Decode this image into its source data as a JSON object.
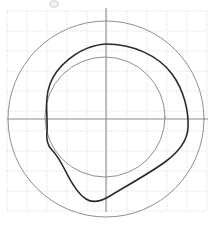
{
  "figure": {
    "width": 218,
    "height": 226,
    "background_color": "#ffffff",
    "title": "",
    "smudge_artifact_label": "scan-smudge"
  },
  "colors": {
    "grid": "#d8d8d8",
    "axis": "#8c8c8c",
    "light_curve": "#8f8f8f",
    "dark_curve": "#2b2b2b"
  },
  "grid": {
    "visible": true,
    "spacing_px": 20,
    "x_start": 7,
    "x_end": 207,
    "y_start": 11,
    "y_end": 211,
    "style": "dotted"
  },
  "axes": {
    "origin_x": 106,
    "origin_y": 119,
    "x_axis_start": 7,
    "x_axis_end": 208,
    "y_axis_start": 8,
    "y_axis_end": 212,
    "xlabel": "",
    "ylabel": "",
    "xticklabels": [],
    "yticklabels": []
  },
  "chart_data": {
    "type": "line",
    "title": "",
    "subtitle": "",
    "xlabel": "",
    "ylabel": "",
    "xlim": [
      -5,
      5
    ],
    "ylim": [
      -5,
      5
    ],
    "grid": true,
    "legend": "none",
    "coordinate_system": "polar-overlay-on-cartesian-grid",
    "annotations": [],
    "series": [
      {
        "name": "outer circle",
        "kind": "circle",
        "color": "#8f8f8f",
        "linewidth": 1,
        "center": [
          106,
          119
        ],
        "radius": 98,
        "values": []
      },
      {
        "name": "inner circle",
        "kind": "circle",
        "color": "#8f8f8f",
        "linewidth": 1,
        "center": [
          105,
          117
        ],
        "radius": 60,
        "values": []
      },
      {
        "name": "irregular closed curve",
        "kind": "closed-path",
        "color": "#2b2b2b",
        "linewidth": 1.6,
        "path": "M 106 44 C 132 44 158 55 172 74 C 184 90 189 112 188 128 C 187 143 176 154 165 162 C 150 173 128 185 110 196 C 100 202 92 203 86 199 C 78 194 72 184 66 172 C 60 160 56 154 52 150 C 47 145 46 139 47 131 C 48 116 44 100 50 84 C 57 65 78 50 94 46 C 98 45 102 44 106 44 Z",
        "extremes": {
          "top_y": 44,
          "right_x": 188,
          "bottom_y": 202,
          "left_x": 44
        },
        "values": []
      }
    ]
  }
}
